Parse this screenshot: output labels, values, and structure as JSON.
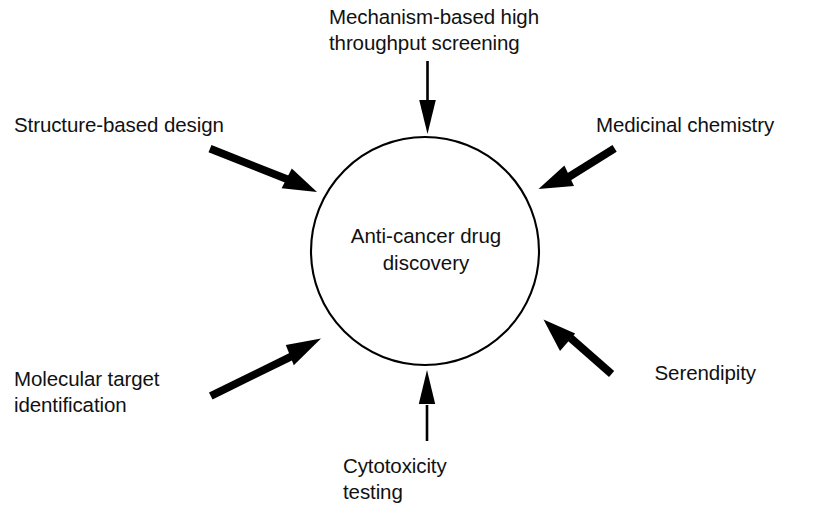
{
  "diagram": {
    "center": {
      "text": "Anti-cancer drug\ndiscovery",
      "shape": "circle",
      "stroke_color": "#000000",
      "fill_color": "#ffffff"
    },
    "text_color": "#111111",
    "background_color": "#ffffff",
    "nodes": [
      {
        "id": "top",
        "label": "Mechanism-based high\nthroughput screening",
        "position": "top",
        "arrow_direction": "down",
        "align": "left"
      },
      {
        "id": "upper-left",
        "label": "Structure-based design",
        "position": "upper-left",
        "arrow_direction": "down-right",
        "align": "left"
      },
      {
        "id": "upper-right",
        "label": "Medicinal chemistry",
        "position": "upper-right",
        "arrow_direction": "down-left",
        "align": "left"
      },
      {
        "id": "lower-left",
        "label": "Molecular target\nidentification",
        "position": "lower-left",
        "arrow_direction": "up-right",
        "align": "left"
      },
      {
        "id": "lower-right",
        "label": "Serendipity",
        "position": "lower-right",
        "arrow_direction": "up-left",
        "align": "right"
      },
      {
        "id": "bottom",
        "label": "Cytotoxicity\ntesting",
        "position": "bottom",
        "arrow_direction": "up",
        "align": "left"
      }
    ]
  }
}
